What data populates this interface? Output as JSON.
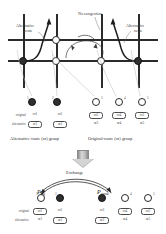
{
  "figure": {
    "type": "diagram"
  },
  "network": {
    "labels": {
      "alt_route_left_line1": "Alternative",
      "alt_route_left_line2": "route",
      "no_congestion": "No congestion",
      "alt_route_right_line1": "Alternative",
      "alt_route_right_line2": "route"
    },
    "nodes": [
      {
        "id": "n1",
        "fill": "dark",
        "x": 15,
        "y": 47
      },
      {
        "id": "n2",
        "fill": "light",
        "x": 48,
        "y": 26
      },
      {
        "id": "n3",
        "fill": "light",
        "x": 48,
        "y": 47
      },
      {
        "id": "n4",
        "fill": "light",
        "x": 93,
        "y": 47
      },
      {
        "id": "n5",
        "fill": "dark",
        "x": 130,
        "y": 47
      }
    ]
  },
  "groups": {
    "alternative": {
      "caption": "Alternative-route (ar) group",
      "row_labels": {
        "original": "original",
        "alternative": "alternative"
      },
      "vehicles": [
        {
          "index": "1",
          "fill": "dark",
          "original": "or1",
          "alternative": "ar1",
          "boxed": "alternative"
        },
        {
          "index": "2",
          "fill": "dark",
          "original": "or2",
          "alternative": "ar2",
          "boxed": "alternative"
        }
      ]
    },
    "original": {
      "caption": "Original-route (or) group",
      "vehicles": [
        {
          "index": "3",
          "fill": "light",
          "original": "or3",
          "alternative": "ar3",
          "boxed": "original"
        },
        {
          "index": "4",
          "fill": "light",
          "original": "or4",
          "alternative": "ar4",
          "boxed": "original"
        },
        {
          "index": "5",
          "fill": "light",
          "original": "or5",
          "alternative": "ar5",
          "boxed": "original"
        }
      ]
    }
  },
  "exchange": {
    "title": "Exchange",
    "prob_request_base": "P",
    "prob_request_sub": "req",
    "prob_agree_base": "P",
    "prob_agree_sub": "agree",
    "row_labels": {
      "original": "original",
      "alternative": "alternative"
    },
    "result": [
      {
        "index": "1",
        "fill": "light",
        "original": "or1",
        "alternative": "ar1",
        "boxed": "original"
      },
      {
        "index": "2",
        "fill": "dark",
        "original": "or2",
        "alternative": "ar2",
        "boxed": "alternative"
      },
      {
        "index": "3",
        "fill": "dark",
        "original": "or3",
        "alternative": "ar3",
        "boxed": "alternative"
      },
      {
        "index": "4",
        "fill": "light",
        "original": "or4",
        "alternative": "ar4",
        "boxed": "original"
      },
      {
        "index": "5",
        "fill": "light",
        "original": "or5",
        "alternative": "ar5",
        "boxed": "original"
      }
    ]
  },
  "colors": {
    "road": "#2b2b2b",
    "node_dark": "#2f2f2f",
    "node_light": "#ffffff",
    "arrow_gray": "#b5b5b5",
    "text": "#3a3a3a"
  }
}
